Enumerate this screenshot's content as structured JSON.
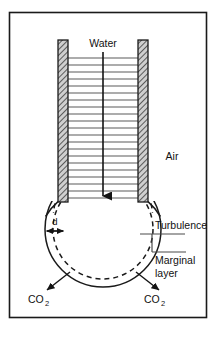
{
  "figure": {
    "labels": {
      "water": "Water",
      "air": "Air",
      "turbulence": "Turbulence",
      "marginal_layer_line1": "Marginal",
      "marginal_layer_line2": "layer",
      "thickness": "d",
      "co2_left_main": "CO",
      "co2_left_sub": "2",
      "co2_right_main": "CO",
      "co2_right_sub": "2"
    },
    "colors": {
      "frame": "#1a1a1a",
      "line": "#1a1a1a",
      "wall_fill": "#c8c8c8",
      "wall_hatch": "#3a3a3a",
      "flow_line": "#555555",
      "background": "#ffffff"
    },
    "geometry": {
      "frame": {
        "x": 9,
        "y": 12,
        "width": 198,
        "height": 306
      },
      "tube": {
        "left_wall_x": 58,
        "right_wall_x": 146,
        "wall_thickness": 10,
        "top_y": 40,
        "bottom_y": 201
      },
      "bulb": {
        "cx": 103,
        "cy": 229,
        "r": 58
      },
      "marginal_layer_gap": 8,
      "flow_line_count": 20,
      "arrow": {
        "x": 103,
        "y_start": 52,
        "y_end": 203
      }
    },
    "elements": [
      "tube-left-wall",
      "tube-right-wall",
      "flow-lines",
      "water-flow-arrow",
      "bulb-outer-circle",
      "bulb-dashed-circle",
      "thickness-dimension",
      "turbulence-leader",
      "marginal-layer-leader",
      "co2-arrow-left",
      "co2-arrow-right"
    ]
  }
}
